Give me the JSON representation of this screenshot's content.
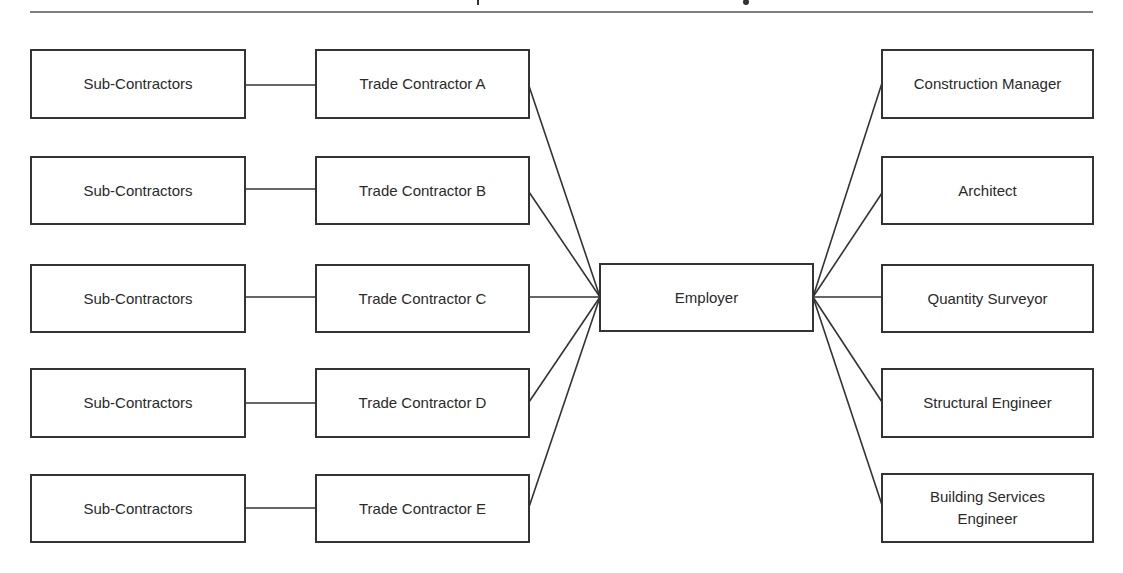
{
  "diagram": {
    "title_visible": "",
    "central_node": {
      "id": "employer",
      "label": "Employer"
    },
    "left_rows": [
      {
        "subcontractor_label": "Sub-Contractors",
        "trade_contractor_label": "Trade Contractor A"
      },
      {
        "subcontractor_label": "Sub-Contractors",
        "trade_contractor_label": "Trade Contractor B"
      },
      {
        "subcontractor_label": "Sub-Contractors",
        "trade_contractor_label": "Trade Contractor C"
      },
      {
        "subcontractor_label": "Sub-Contractors",
        "trade_contractor_label": "Trade Contractor D"
      },
      {
        "subcontractor_label": "Sub-Contractors",
        "trade_contractor_label": "Trade Contractor E"
      }
    ],
    "right_nodes": [
      {
        "label": "Construction Manager"
      },
      {
        "label": "Architect"
      },
      {
        "label": "Quantity Surveyor"
      },
      {
        "label": "Structural Engineer"
      },
      {
        "label": "Building Services\nEngineer",
        "label_line1": "Building Services",
        "label_line2": "Engineer"
      }
    ],
    "edges": [
      {
        "from": "Sub-Contractors (row A)",
        "to": "Trade Contractor A"
      },
      {
        "from": "Sub-Contractors (row B)",
        "to": "Trade Contractor B"
      },
      {
        "from": "Sub-Contractors (row C)",
        "to": "Trade Contractor C"
      },
      {
        "from": "Sub-Contractors (row D)",
        "to": "Trade Contractor D"
      },
      {
        "from": "Sub-Contractors (row E)",
        "to": "Trade Contractor E"
      },
      {
        "from": "Trade Contractor A",
        "to": "Employer"
      },
      {
        "from": "Trade Contractor B",
        "to": "Employer"
      },
      {
        "from": "Trade Contractor C",
        "to": "Employer"
      },
      {
        "from": "Trade Contractor D",
        "to": "Employer"
      },
      {
        "from": "Trade Contractor E",
        "to": "Employer"
      },
      {
        "from": "Employer",
        "to": "Construction Manager"
      },
      {
        "from": "Employer",
        "to": "Architect"
      },
      {
        "from": "Employer",
        "to": "Quantity Surveyor"
      },
      {
        "from": "Employer",
        "to": "Structural Engineer"
      },
      {
        "from": "Employer",
        "to": "Building Services Engineer"
      }
    ],
    "colors": {
      "stroke": "#333333",
      "text": "#2a2a2a",
      "background": "#ffffff"
    }
  }
}
